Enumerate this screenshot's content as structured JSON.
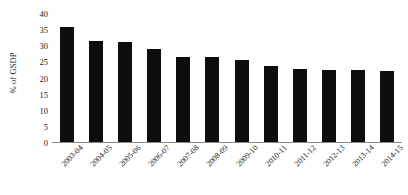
{
  "chart_data": {
    "type": "bar",
    "title": "",
    "subtitle": "",
    "xlabel": "",
    "ylabel": "% of GSDP",
    "ylim": [
      0,
      40
    ],
    "yticks": [
      0,
      5,
      10,
      15,
      20,
      25,
      30,
      35,
      40
    ],
    "grid": false,
    "legend": null,
    "bar_color": "#0d0d0d",
    "axis_color": "#8a8a8a",
    "text_color": "#1a1a1a",
    "x_label_rotation_deg": -45,
    "categories": [
      "2003-04",
      "2004-05",
      "2005-06",
      "2006-07",
      "2007-08",
      "2008-09",
      "2009-10",
      "2010-11",
      "2011-12",
      "2012-13",
      "2013-14",
      "2014-15"
    ],
    "values": [
      35.6,
      31.2,
      31.0,
      28.7,
      26.5,
      26.4,
      25.5,
      23.5,
      22.6,
      22.3,
      22.2,
      22.0
    ]
  }
}
